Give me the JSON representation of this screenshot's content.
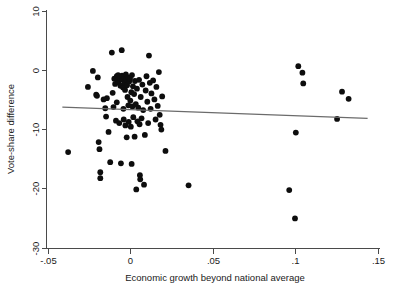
{
  "chart_data": {
    "type": "scatter",
    "title": "",
    "xlabel": "Economic growth beyond national average",
    "ylabel": "Vote-share difference",
    "xlim": [
      -0.05,
      0.15
    ],
    "ylim": [
      -30,
      10
    ],
    "xticks": [
      -0.05,
      0,
      0.05,
      0.1,
      0.15
    ],
    "xticklabels": [
      "-.05",
      "0",
      ".05",
      ".1",
      ".15"
    ],
    "yticks": [
      10,
      0,
      -10,
      -20,
      -30
    ],
    "yticklabels": [
      "10",
      "0",
      "-10",
      "-20",
      "-30"
    ],
    "grid": false,
    "legend": null,
    "marker": "filled-circle",
    "marker_color": "#0d0d0d",
    "fit_line": {
      "label": "linear fit",
      "color": "#6b6b6b",
      "x_start": -0.041,
      "y_start": -6.3,
      "x_end": 0.144,
      "y_end": -8.2
    },
    "points": [
      {
        "x": -0.0375,
        "y": -13.9
      },
      {
        "x": -0.0255,
        "y": -2.9
      },
      {
        "x": -0.0225,
        "y": -0.2
      },
      {
        "x": -0.0205,
        "y": -4.2
      },
      {
        "x": -0.02,
        "y": -4.4
      },
      {
        "x": -0.0195,
        "y": -1.3
      },
      {
        "x": -0.019,
        "y": -12.2
      },
      {
        "x": -0.0185,
        "y": -13.4
      },
      {
        "x": -0.018,
        "y": -17.3
      },
      {
        "x": -0.018,
        "y": -18.3
      },
      {
        "x": -0.016,
        "y": -5.0
      },
      {
        "x": -0.015,
        "y": -6.5
      },
      {
        "x": -0.0145,
        "y": -7.9
      },
      {
        "x": -0.014,
        "y": -4.8
      },
      {
        "x": -0.013,
        "y": -10.5
      },
      {
        "x": -0.012,
        "y": -15.6
      },
      {
        "x": -0.011,
        "y": 2.9
      },
      {
        "x": -0.0105,
        "y": -3.9
      },
      {
        "x": -0.01,
        "y": -6.3
      },
      {
        "x": -0.0095,
        "y": -1.5
      },
      {
        "x": -0.009,
        "y": -2.4
      },
      {
        "x": -0.0085,
        "y": -8.6
      },
      {
        "x": -0.008,
        "y": -1.1
      },
      {
        "x": -0.008,
        "y": -5.5
      },
      {
        "x": -0.0075,
        "y": -1.8
      },
      {
        "x": -0.0072,
        "y": -0.9
      },
      {
        "x": -0.007,
        "y": -2.1
      },
      {
        "x": -0.0065,
        "y": -9.0
      },
      {
        "x": -0.006,
        "y": -1.4
      },
      {
        "x": -0.0058,
        "y": -2.7
      },
      {
        "x": -0.0055,
        "y": -15.8
      },
      {
        "x": -0.005,
        "y": 3.3
      },
      {
        "x": -0.0048,
        "y": -1.0
      },
      {
        "x": -0.0045,
        "y": -1.7
      },
      {
        "x": -0.0042,
        "y": -3.0
      },
      {
        "x": -0.004,
        "y": -6.6
      },
      {
        "x": -0.0038,
        "y": -8.4
      },
      {
        "x": -0.0035,
        "y": -1.2
      },
      {
        "x": -0.0032,
        "y": -2.2
      },
      {
        "x": -0.003,
        "y": -3.4
      },
      {
        "x": -0.0028,
        "y": -9.4
      },
      {
        "x": -0.0025,
        "y": -0.8
      },
      {
        "x": -0.0022,
        "y": -1.6
      },
      {
        "x": -0.002,
        "y": -11.4
      },
      {
        "x": -0.0018,
        "y": -2.6
      },
      {
        "x": -0.0015,
        "y": -4.6
      },
      {
        "x": -0.0012,
        "y": -1.3
      },
      {
        "x": -0.001,
        "y": -6.0
      },
      {
        "x": -0.0008,
        "y": -8.8
      },
      {
        "x": -0.0005,
        "y": -2.0
      },
      {
        "x": 0.0,
        "y": -1.5
      },
      {
        "x": 0.0002,
        "y": -5.2
      },
      {
        "x": 0.0005,
        "y": -9.6
      },
      {
        "x": 0.0008,
        "y": -3.8
      },
      {
        "x": 0.001,
        "y": -15.9
      },
      {
        "x": 0.0012,
        "y": -0.9
      },
      {
        "x": 0.0015,
        "y": -6.2
      },
      {
        "x": 0.0018,
        "y": -2.8
      },
      {
        "x": 0.002,
        "y": -8.0
      },
      {
        "x": 0.0025,
        "y": -4.1
      },
      {
        "x": 0.0028,
        "y": -11.3
      },
      {
        "x": 0.003,
        "y": -1.9
      },
      {
        "x": 0.0035,
        "y": -5.8
      },
      {
        "x": 0.0038,
        "y": -20.2
      },
      {
        "x": 0.0042,
        "y": -3.2
      },
      {
        "x": 0.0045,
        "y": -8.7
      },
      {
        "x": 0.005,
        "y": -6.4
      },
      {
        "x": 0.0055,
        "y": -1.7
      },
      {
        "x": 0.0058,
        "y": -9.2
      },
      {
        "x": 0.006,
        "y": -17.8
      },
      {
        "x": 0.0062,
        "y": -18.5
      },
      {
        "x": 0.0065,
        "y": -4.6
      },
      {
        "x": 0.007,
        "y": -8.2
      },
      {
        "x": 0.0075,
        "y": -2.5
      },
      {
        "x": 0.008,
        "y": -6.8
      },
      {
        "x": 0.0085,
        "y": -19.4
      },
      {
        "x": 0.009,
        "y": -11.0
      },
      {
        "x": 0.0095,
        "y": -3.5
      },
      {
        "x": 0.01,
        "y": -1.1
      },
      {
        "x": 0.0105,
        "y": -5.4
      },
      {
        "x": 0.011,
        "y": -9.0
      },
      {
        "x": 0.0115,
        "y": 2.4
      },
      {
        "x": 0.012,
        "y": -2.2
      },
      {
        "x": 0.0125,
        "y": -6.6
      },
      {
        "x": 0.013,
        "y": -4.0
      },
      {
        "x": 0.014,
        "y": -1.8
      },
      {
        "x": 0.0148,
        "y": -5.0
      },
      {
        "x": 0.0155,
        "y": -8.4
      },
      {
        "x": 0.016,
        "y": -2.9
      },
      {
        "x": 0.0168,
        "y": -6.1
      },
      {
        "x": 0.0175,
        "y": -0.4
      },
      {
        "x": 0.018,
        "y": -7.6
      },
      {
        "x": 0.0185,
        "y": -9.3
      },
      {
        "x": 0.019,
        "y": -10.1
      },
      {
        "x": 0.0195,
        "y": -4.5
      },
      {
        "x": 0.0215,
        "y": -13.7
      },
      {
        "x": 0.0355,
        "y": -19.5
      },
      {
        "x": 0.0965,
        "y": -20.3
      },
      {
        "x": 0.1,
        "y": -25.1
      },
      {
        "x": 0.1005,
        "y": -10.6
      },
      {
        "x": 0.102,
        "y": 0.6
      },
      {
        "x": 0.1045,
        "y": -0.5
      },
      {
        "x": 0.105,
        "y": -2.3
      },
      {
        "x": 0.1255,
        "y": -8.3
      },
      {
        "x": 0.1285,
        "y": -3.7
      },
      {
        "x": 0.1325,
        "y": -4.9
      }
    ]
  }
}
